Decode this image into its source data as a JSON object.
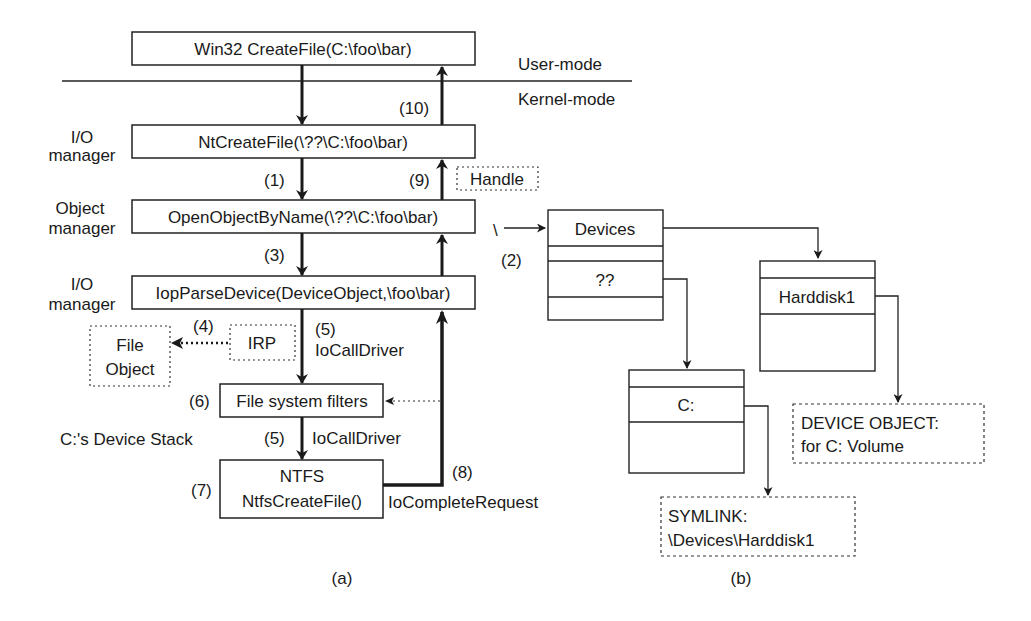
{
  "figure": {
    "panel_a": {
      "caption": "(a)",
      "mode_labels": {
        "user": "User-mode",
        "kernel": "Kernel-mode"
      },
      "layer_labels": {
        "io_manager_1": [
          "I/O",
          "manager"
        ],
        "object_manager": [
          "Object",
          "manager"
        ],
        "io_manager_2": [
          "I/O",
          "manager"
        ],
        "device_stack": "C:'s Device Stack"
      },
      "boxes": {
        "win32": "Win32 CreateFile(C:\\foo\\bar)",
        "ntcreatefile": "NtCreateFile(\\??\\C:\\foo\\bar)",
        "openobject": "OpenObjectByName(\\??\\C:\\foo\\bar)",
        "iopparse": "IopParseDevice(DeviceObject,\\foo\\bar)",
        "filters": "File system filters",
        "ntfs_line1": "NTFS",
        "ntfs_line2": "NtfsCreateFile()",
        "file_object_line1": "File",
        "file_object_line2": "Object",
        "irp": "IRP",
        "handle": "Handle"
      },
      "step_labels": {
        "s1": "(1)",
        "s3": "(3)",
        "s4": "(4)",
        "s5a": "(5)",
        "s5a_text": "IoCallDriver",
        "s6": "(6)",
        "s5b": "(5)",
        "s5b_text": "IoCallDriver",
        "s7": "(7)",
        "s8": "(8)",
        "s8_text": "IoCompleteRequest",
        "s9": "(9)",
        "s10": "(10)"
      }
    },
    "panel_b": {
      "caption": "(b)",
      "root_label": "\\",
      "step2": "(2)",
      "devices_table": {
        "rows": [
          "Devices",
          "",
          "??",
          ""
        ]
      },
      "harddisk_table": {
        "rows": [
          "",
          "Harddisk1",
          ""
        ]
      },
      "c_table": {
        "rows": [
          "",
          "C:",
          ""
        ]
      },
      "device_object": {
        "line1": "DEVICE OBJECT:",
        "line2": "for C: Volume"
      },
      "symlink": {
        "line1": "SYMLINK:",
        "line2": "\\Devices\\Harddisk1"
      }
    }
  }
}
